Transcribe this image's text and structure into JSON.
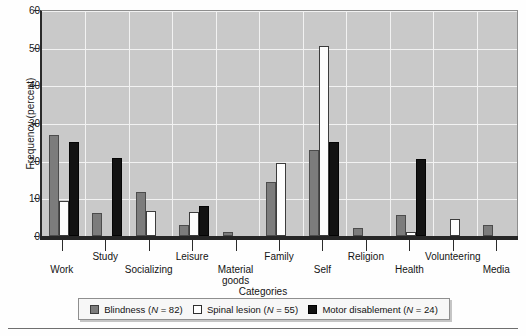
{
  "chart_data": {
    "type": "bar",
    "title": "",
    "xlabel": "Categories",
    "ylabel": "Frequency (percent)",
    "ylim": [
      0,
      60
    ],
    "yticks": [
      0,
      10,
      20,
      30,
      40,
      50,
      60
    ],
    "grid": true,
    "legend_position": "bottom",
    "categories": [
      "Work",
      "Study",
      "Socializing",
      "Leisure",
      "Material goods",
      "Family",
      "Self",
      "Religion",
      "Health",
      "Volunteering",
      "Media"
    ],
    "series": [
      {
        "name": "Blindness",
        "label": "Blindness (N = 82)",
        "n": 82,
        "color": "#7c7c7c",
        "values": [
          26.8,
          6.0,
          11.7,
          3.0,
          1.0,
          14.3,
          22.8,
          2.0,
          5.6,
          0.0,
          3.0
        ]
      },
      {
        "name": "Spinal lesion",
        "label": "Spinal lesion (N = 55)",
        "n": 55,
        "color": "#ffffff",
        "values": [
          9.2,
          0.0,
          6.6,
          6.4,
          0.0,
          19.4,
          50.4,
          0.0,
          1.0,
          4.5,
          0.0
        ]
      },
      {
        "name": "Motor disablement",
        "label": "Motor disablement (N = 24)",
        "n": 24,
        "color": "#121212",
        "values": [
          25.0,
          20.8,
          0.0,
          8.0,
          0.0,
          0.0,
          25.0,
          0.0,
          20.5,
          0.0,
          0.0
        ]
      }
    ]
  },
  "axis": {
    "y_title": "Frequency (percent)",
    "x_title": "Categories",
    "y_tick_labels": [
      "0",
      "10",
      "20",
      "30",
      "40",
      "50",
      "60"
    ],
    "x_tick_labels": [
      "Work",
      "Study",
      "Socializing",
      "Leisure",
      "Material goods",
      "Family",
      "Self",
      "Religion",
      "Health",
      "Volunteering",
      "Media"
    ]
  },
  "legend": {
    "items": [
      {
        "label": "Blindness (N = 82)",
        "name": "Blindness",
        "n_text": "N = 82",
        "swatch": "blind"
      },
      {
        "label": "Spinal lesion (N = 55)",
        "name": "Spinal lesion",
        "n_text": "N = 55",
        "swatch": "spinal"
      },
      {
        "label": "Motor disablement (N = 24)",
        "name": "Motor disablement",
        "n_text": "N = 24",
        "swatch": "motor"
      }
    ]
  },
  "colors": {
    "plot_background": "#c9c9c9",
    "gridline": "#f2f2f2",
    "axis": "#2a2a2a",
    "blindness": "#7c7c7c",
    "spinal_lesion": "#ffffff",
    "motor_disablement": "#121212"
  }
}
